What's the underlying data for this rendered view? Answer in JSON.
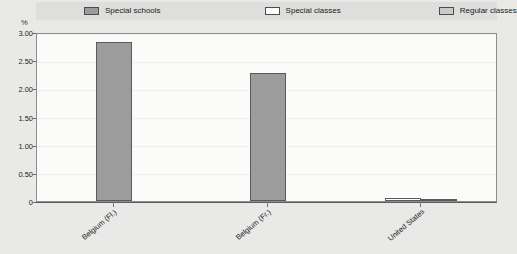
{
  "chart_data": {
    "type": "bar",
    "title": "",
    "xlabel": "",
    "ylabel": "%",
    "ylim": [
      0,
      3.0
    ],
    "yticks": [
      "0",
      "0.50",
      "1.00",
      "1.50",
      "2.00",
      "2.50",
      "3.00"
    ],
    "ytick_values": [
      0,
      0.5,
      1.0,
      1.5,
      2.0,
      2.5,
      3.0
    ],
    "grid": true,
    "legend_position": "top",
    "categories": [
      "Belgium (Fl.)",
      "Belgium (Fr.)",
      "United States"
    ],
    "series": [
      {
        "name": "Special schools",
        "color": "#9c9c9c",
        "values": [
          2.83,
          2.28,
          0
        ]
      },
      {
        "name": "Special classes",
        "color": "#fdfdfd",
        "values": [
          0,
          0,
          0.06
        ]
      },
      {
        "name": "Regular classes",
        "color": "#c9c9c9",
        "values": [
          0,
          0,
          0.03
        ]
      }
    ]
  },
  "legend": {
    "items": [
      {
        "label": "Special schools",
        "swatch": "#9c9c9c"
      },
      {
        "label": "Special classes",
        "swatch": "#fdfdfd"
      },
      {
        "label": "Regular classes",
        "swatch": "#c9c9c9"
      }
    ]
  },
  "axes": {
    "y_unit": "%",
    "y_tick_labels": [
      "3.00",
      "2.50",
      "2.00",
      "1.50",
      "1.00",
      "0.50",
      "0"
    ],
    "x_tick_labels": [
      "Belgium (Fl.)",
      "Belgium (Fr.)",
      "United States"
    ]
  },
  "colors": {
    "page_background": "#e9e9e7",
    "legend_background": "#dededc",
    "plot_background": "#fbfbfa",
    "axis_line": "#5d5d5d",
    "bar_border": "#5a5a5a",
    "gridline": "#efefee"
  }
}
